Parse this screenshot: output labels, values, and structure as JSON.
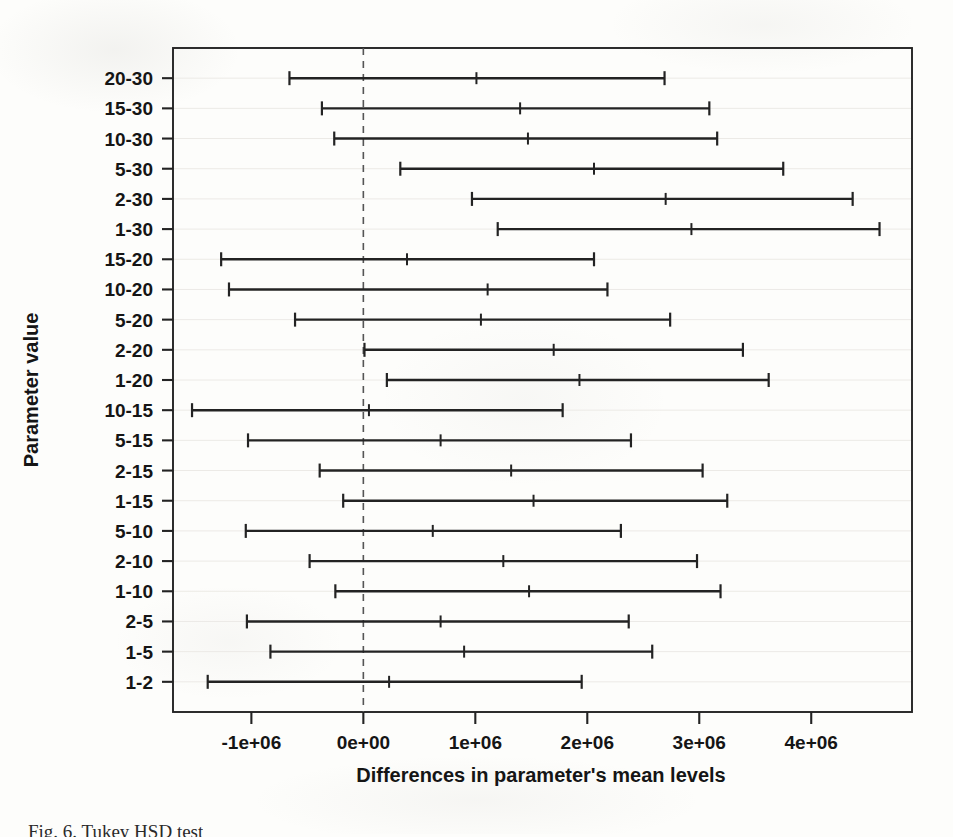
{
  "figure": {
    "caption": "Fig. 6. Tukey HSD test",
    "yaxis_title": "Parameter value",
    "xaxis_title": "Differences in parameter's mean levels",
    "line_color": "#232323",
    "zero_line_color": "#555555",
    "gridline_color": "#eceae6",
    "background_color": "#fdfdfb"
  },
  "chart_data": {
    "type": "bar",
    "subtype": "tukey-hsd-confidence-intervals",
    "title": "",
    "xlabel": "Differences in parameter's mean levels",
    "ylabel": "Parameter value",
    "xlim": [
      -1700000,
      4900000
    ],
    "ylim": [
      0,
      21
    ],
    "grid": true,
    "legend": null,
    "zero_reference_line": 0,
    "xticks": [
      -1000000,
      0,
      1000000,
      2000000,
      3000000,
      4000000
    ],
    "xtick_labels": [
      "-1e+06",
      "0e+00",
      "1e+06",
      "2e+06",
      "3e+06",
      "4e+06"
    ],
    "categories": [
      "20-30",
      "15-30",
      "10-30",
      "5-30",
      "2-30",
      "1-30",
      "15-20",
      "10-20",
      "5-20",
      "2-20",
      "1-20",
      "10-15",
      "5-15",
      "2-15",
      "1-15",
      "5-10",
      "2-10",
      "1-10",
      "2-5",
      "1-5",
      "1-2"
    ],
    "series": [
      {
        "name": "mean difference",
        "values": [
          1010000,
          1400000,
          1470000,
          2060000,
          2700000,
          2930000,
          390000,
          1110000,
          1050000,
          1700000,
          1930000,
          50000,
          690000,
          1320000,
          1520000,
          620000,
          1250000,
          1480000,
          690000,
          900000,
          230000
        ]
      },
      {
        "name": "lower confidence limit",
        "values": [
          -660000,
          -370000,
          -260000,
          330000,
          970000,
          1200000,
          -1270000,
          -1200000,
          -610000,
          10000,
          210000,
          -1530000,
          -1030000,
          -390000,
          -180000,
          -1050000,
          -480000,
          -250000,
          -1040000,
          -830000,
          -1390000
        ]
      },
      {
        "name": "upper confidence limit",
        "values": [
          2690000,
          3090000,
          3160000,
          3750000,
          4370000,
          4610000,
          2060000,
          2180000,
          2740000,
          3390000,
          3620000,
          1780000,
          2390000,
          3030000,
          3250000,
          2300000,
          2980000,
          3190000,
          2370000,
          2580000,
          1950000
        ]
      }
    ],
    "rows": [
      {
        "label": "20-30",
        "lower": -660000,
        "mean": 1010000,
        "upper": 2690000
      },
      {
        "label": "15-30",
        "lower": -370000,
        "mean": 1400000,
        "upper": 3090000
      },
      {
        "label": "10-30",
        "lower": -260000,
        "mean": 1470000,
        "upper": 3160000
      },
      {
        "label": "5-30",
        "lower": 330000,
        "mean": 2060000,
        "upper": 3750000
      },
      {
        "label": "2-30",
        "lower": 970000,
        "mean": 2700000,
        "upper": 4370000
      },
      {
        "label": "1-30",
        "lower": 1200000,
        "mean": 2930000,
        "upper": 4610000
      },
      {
        "label": "15-20",
        "lower": -1270000,
        "mean": 390000,
        "upper": 2060000
      },
      {
        "label": "10-20",
        "lower": -1200000,
        "mean": 1110000,
        "upper": 2180000
      },
      {
        "label": "5-20",
        "lower": -610000,
        "mean": 1050000,
        "upper": 2740000
      },
      {
        "label": "2-20",
        "lower": 10000,
        "mean": 1700000,
        "upper": 3390000
      },
      {
        "label": "1-20",
        "lower": 210000,
        "mean": 1930000,
        "upper": 3620000
      },
      {
        "label": "10-15",
        "lower": -1530000,
        "mean": 50000,
        "upper": 1780000
      },
      {
        "label": "5-15",
        "lower": -1030000,
        "mean": 690000,
        "upper": 2390000
      },
      {
        "label": "2-15",
        "lower": -390000,
        "mean": 1320000,
        "upper": 3030000
      },
      {
        "label": "1-15",
        "lower": -180000,
        "mean": 1520000,
        "upper": 3250000
      },
      {
        "label": "5-10",
        "lower": -1050000,
        "mean": 620000,
        "upper": 2300000
      },
      {
        "label": "2-10",
        "lower": -480000,
        "mean": 1250000,
        "upper": 2980000
      },
      {
        "label": "1-10",
        "lower": -250000,
        "mean": 1480000,
        "upper": 3190000
      },
      {
        "label": "2-5",
        "lower": -1040000,
        "mean": 690000,
        "upper": 2370000
      },
      {
        "label": "1-5",
        "lower": -830000,
        "mean": 900000,
        "upper": 2580000
      },
      {
        "label": "1-2",
        "lower": -1390000,
        "mean": 230000,
        "upper": 1950000
      }
    ]
  }
}
